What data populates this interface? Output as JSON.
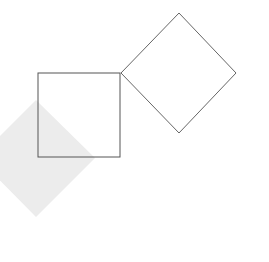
{
  "canvas": {
    "width": 269,
    "height": 262,
    "background": "#ffffff"
  },
  "shapes": {
    "shaded_diamond": {
      "points": "36,100 95,158 36,217 -22,158",
      "fill": "#ececec",
      "stroke": "none"
    },
    "square": {
      "x": 38,
      "y": 73,
      "width": 82,
      "height": 84,
      "fill": "none",
      "stroke": "#555555"
    },
    "outline_diamond": {
      "points": "179,13 236,73 179,133 121,73",
      "fill": "none",
      "stroke": "#666666"
    }
  }
}
